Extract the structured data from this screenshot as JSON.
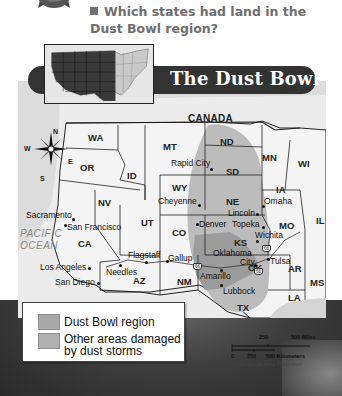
{
  "question": {
    "text": "Which states had land in the Dust Bowl region?"
  },
  "map": {
    "title": "The Dust Bowl",
    "country_label": "CANADA",
    "ocean_label_line1": "PACIFIC",
    "ocean_label_line2": "OCEAN",
    "compass": {
      "n": "N",
      "s": "S",
      "e": "E",
      "w": "W"
    },
    "states": [
      {
        "abbr": "WA",
        "x": 88,
        "y": 138
      },
      {
        "abbr": "OR",
        "x": 80,
        "y": 167
      },
      {
        "abbr": "ID",
        "x": 127,
        "y": 176
      },
      {
        "abbr": "MT",
        "x": 163,
        "y": 146
      },
      {
        "abbr": "ND",
        "x": 223,
        "y": 141
      },
      {
        "abbr": "SD",
        "x": 224,
        "y": 171
      },
      {
        "abbr": "MN",
        "x": 262,
        "y": 157
      },
      {
        "abbr": "WI",
        "x": 298,
        "y": 163
      },
      {
        "abbr": "WY",
        "x": 173,
        "y": 186
      },
      {
        "abbr": "NE",
        "x": 224,
        "y": 201
      },
      {
        "abbr": "IA",
        "x": 275,
        "y": 189
      },
      {
        "abbr": "NV",
        "x": 98,
        "y": 200
      },
      {
        "abbr": "UT",
        "x": 141,
        "y": 221
      },
      {
        "abbr": "CO",
        "x": 175,
        "y": 232
      },
      {
        "abbr": "KS",
        "x": 234,
        "y": 242
      },
      {
        "abbr": "MO",
        "x": 279,
        "y": 225
      },
      {
        "abbr": "IL",
        "x": 315,
        "y": 218
      },
      {
        "abbr": "CA",
        "x": 78,
        "y": 242
      },
      {
        "abbr": "AZ",
        "x": 133,
        "y": 278
      },
      {
        "abbr": "NM",
        "x": 177,
        "y": 280
      },
      {
        "abbr": "OK",
        "x": 247,
        "y": 266
      },
      {
        "abbr": "AR",
        "x": 288,
        "y": 268
      },
      {
        "abbr": "MS",
        "x": 310,
        "y": 280
      },
      {
        "abbr": "TX",
        "x": 237,
        "y": 306
      },
      {
        "abbr": "LA",
        "x": 288,
        "y": 296
      }
    ],
    "cities": [
      {
        "name": "Rapid City",
        "x": 178,
        "y": 158,
        "dx": 201,
        "dy": 168
      },
      {
        "name": "Cheyenne",
        "x": 160,
        "y": 198,
        "dx": 198,
        "dy": 204
      },
      {
        "name": "Omaha",
        "x": 264,
        "y": 200,
        "dx": 262,
        "dy": 205
      },
      {
        "name": "Lincoln",
        "x": 228,
        "y": 209,
        "dx": 256,
        "dy": 213
      },
      {
        "name": "Denver",
        "x": 199,
        "y": 222,
        "dx": 196,
        "dy": 223
      },
      {
        "name": "Topeka",
        "x": 232,
        "y": 222,
        "dx": 262,
        "dy": 226
      },
      {
        "name": "Wichita",
        "x": 255,
        "y": 233,
        "dx": 256,
        "dy": 240
      },
      {
        "name": "Sacramento",
        "x": 20,
        "y": 211,
        "dx": 72,
        "dy": 218
      },
      {
        "name": "San Francisco",
        "x": 67,
        "y": 222,
        "dx": 64,
        "dy": 223
      },
      {
        "name": "Flagstaff",
        "x": 128,
        "y": 250,
        "dx": 145,
        "dy": 261
      },
      {
        "name": "Gallup",
        "x": 168,
        "y": 254,
        "dx": 166,
        "dy": 261
      },
      {
        "name": "Oklahoma",
        "x": 213,
        "y": 249
      },
      {
        "name": "City",
        "x": 219,
        "y": 258,
        "dx": 254,
        "dy": 264
      },
      {
        "name": "Tulsa",
        "x": 270,
        "y": 255,
        "dx": 267,
        "dy": 258
      },
      {
        "name": "Los Angeles",
        "x": 40,
        "y": 263,
        "dx": 88,
        "dy": 267
      },
      {
        "name": "Needles",
        "x": 106,
        "y": 267,
        "dx": 119,
        "dy": 264
      },
      {
        "name": "Amarillo",
        "x": 200,
        "y": 271,
        "dx": 220,
        "dy": 269
      },
      {
        "name": "San Diego",
        "x": 55,
        "y": 278,
        "dx": 97,
        "dy": 282
      },
      {
        "name": "Lubbock",
        "x": 219,
        "y": 287,
        "dx": 220,
        "dy": 284
      }
    ],
    "highway_label": "66",
    "highways": [
      {
        "x": 193,
        "y": 263
      },
      {
        "x": 262,
        "y": 245
      },
      {
        "x": 255,
        "y": 269
      }
    ],
    "scale": {
      "miles_250": "250",
      "miles_500": "500 Miles",
      "km_0": "0",
      "km_250": "250",
      "km_500": "500 Kilometers",
      "projection": "Albers Equal-Area Projection"
    },
    "legend": {
      "items": [
        {
          "label_line1": "Dust Bowl region",
          "label_line2": "",
          "color": "#a8a8a8"
        },
        {
          "label_line1": "Other areas damaged",
          "label_line2": "by dust storms",
          "color": "#b0b0b0"
        }
      ]
    }
  },
  "colors": {
    "banner_bg": "#333333",
    "question_text": "#6e6e6e",
    "dust_bowl_fill": "#9a9a9a",
    "damaged_fill": "#b8b8b8",
    "land": "#eeeeee",
    "ocean": "#dcdcdc"
  }
}
